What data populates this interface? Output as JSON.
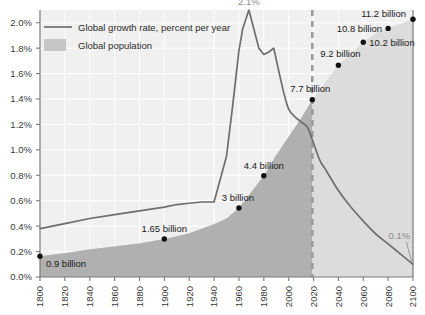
{
  "chart_data": {
    "type": "area",
    "title": "",
    "subtitle": "",
    "xlabel": "",
    "ylabel": "",
    "grid": true,
    "legend_position": "top-left",
    "xlim": [
      1800,
      2100
    ],
    "ylim": [
      0.0,
      2.1
    ],
    "x_ticks": [
      1800,
      1820,
      1840,
      1860,
      1880,
      1900,
      1920,
      1940,
      1960,
      1980,
      2000,
      2020,
      2040,
      2060,
      2080,
      2100
    ],
    "x_tick_labels": [
      "1800",
      "1820",
      "1840",
      "1860",
      "1880",
      "1900",
      "1920",
      "1940",
      "1960",
      "1980",
      "2000",
      "2020",
      "2040",
      "2060",
      "2080",
      "2100"
    ],
    "y_ticks": [
      0.0,
      0.2,
      0.4,
      0.6,
      0.8,
      1.0,
      1.2,
      1.4,
      1.6,
      1.8,
      2.0
    ],
    "y_tick_labels": [
      "0.0%",
      "0.2%",
      "0.4%",
      "0.6%",
      "0.8%",
      "1.0%",
      "1.2%",
      "1.4%",
      "1.6%",
      "1.8%",
      "2.0%"
    ],
    "legend": [
      {
        "name": "Global growth rate, percent per year",
        "marker": "line",
        "color": "#6e6e6e"
      },
      {
        "name": "Global population",
        "marker": "area",
        "color": "#b4b4b4"
      }
    ],
    "series": [
      {
        "name": "Global growth rate, percent per year",
        "type": "line",
        "unit": "percent per year",
        "color": "#6e6e6e",
        "x": [
          1800,
          1820,
          1840,
          1860,
          1880,
          1900,
          1910,
          1920,
          1930,
          1940,
          1950,
          1955,
          1960,
          1963,
          1968,
          1972,
          1976,
          1980,
          1984,
          1988,
          1992,
          1996,
          2000,
          2005,
          2010,
          2015,
          2019,
          2025,
          2030,
          2040,
          2050,
          2060,
          2070,
          2080,
          2090,
          2100
        ],
        "values": [
          0.38,
          0.42,
          0.46,
          0.49,
          0.52,
          0.55,
          0.57,
          0.58,
          0.59,
          0.59,
          0.95,
          1.35,
          1.78,
          1.95,
          2.1,
          1.95,
          1.8,
          1.75,
          1.77,
          1.8,
          1.62,
          1.45,
          1.32,
          1.26,
          1.22,
          1.18,
          1.08,
          0.92,
          0.84,
          0.68,
          0.55,
          0.44,
          0.34,
          0.26,
          0.18,
          0.1
        ]
      },
      {
        "name": "Global population",
        "type": "area",
        "unit": "billions",
        "color_historical": "#b0b0b0",
        "color_projection": "#dcdcdc",
        "x": [
          1800,
          1820,
          1840,
          1860,
          1880,
          1900,
          1920,
          1940,
          1950,
          1960,
          1970,
          1980,
          1990,
          2000,
          2010,
          2019,
          2030,
          2040,
          2050,
          2060,
          2070,
          2080,
          2090,
          2100
        ],
        "values": [
          0.9,
          1.04,
          1.2,
          1.33,
          1.46,
          1.65,
          1.9,
          2.3,
          2.54,
          3.0,
          3.7,
          4.4,
          5.3,
          6.1,
          6.9,
          7.7,
          8.5,
          9.2,
          9.7,
          10.2,
          10.6,
          10.8,
          11.0,
          11.2
        ]
      }
    ],
    "population_max_billions": 11.6,
    "projection_start_year": 2019,
    "annotations": [
      {
        "label": "0.9 billion",
        "x": 1800,
        "y_billions": 0.9,
        "marker": true,
        "text_anchor": "start",
        "dx": 6,
        "dy": 11
      },
      {
        "label": "1.65 billion",
        "x": 1900,
        "y_billions": 1.65,
        "marker": true,
        "text_anchor": "middle",
        "dx": 0,
        "dy": -7
      },
      {
        "label": "3 billion",
        "x": 1960,
        "y_billions": 3.0,
        "marker": true,
        "text_anchor": "middle",
        "dx": -1,
        "dy": -7
      },
      {
        "label": "4.4 billion",
        "x": 1980,
        "y_billions": 4.4,
        "marker": true,
        "text_anchor": "middle",
        "dx": 0,
        "dy": -7
      },
      {
        "label": "7.7 billion",
        "x": 2019,
        "y_billions": 7.7,
        "marker": true,
        "text_anchor": "middle",
        "dx": -2,
        "dy": -8
      },
      {
        "label": "9.2 billion",
        "x": 2040,
        "y_billions": 9.2,
        "marker": true,
        "text_anchor": "middle",
        "dx": 2,
        "dy": -8
      },
      {
        "label": "10.2 billion",
        "x": 2060,
        "y_billions": 10.2,
        "marker": true,
        "text_anchor": "start",
        "dx": 6,
        "dy": 4
      },
      {
        "label": "10.8 billion",
        "x": 2080,
        "y_billions": 10.8,
        "marker": true,
        "text_anchor": "end",
        "dx": -6,
        "dy": 4
      },
      {
        "label": "11.2 billion",
        "x": 2100,
        "y_billions": 11.2,
        "marker": true,
        "text_anchor": "end",
        "dx": -7,
        "dy": -2
      }
    ],
    "peak_annotation": {
      "label": "2.1%",
      "x": 1968,
      "y": 2.1
    },
    "tail_annotation": {
      "label": "0.1%",
      "x": 2089,
      "y": 0.3
    },
    "colors": {
      "line": "#6e6e6e",
      "population_historical": "#b0b0b0",
      "population_projection": "#dcdcdc",
      "plot_background": "#f0f0f0",
      "grid": "#ffffff",
      "axis": "#7a7a7a",
      "marker": "#111111",
      "divider_dash": "#9a9a9a"
    }
  }
}
